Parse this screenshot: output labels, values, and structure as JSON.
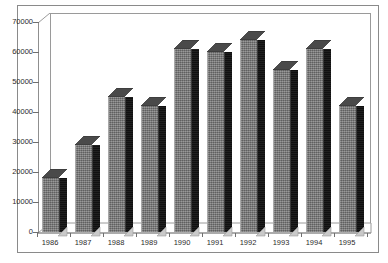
{
  "chart_data": {
    "type": "bar",
    "title": "",
    "subtitle": "",
    "xlabel": "",
    "ylabel": "",
    "categories": [
      "1986",
      "1987",
      "1988",
      "1989",
      "1990",
      "1991",
      "1992",
      "1993",
      "1994",
      "1995"
    ],
    "values": [
      18000,
      29000,
      45000,
      42000,
      61000,
      60000,
      64000,
      54000,
      61000,
      42000
    ],
    "series": [
      {
        "name": "",
        "values": [
          18000,
          29000,
          45000,
          42000,
          61000,
          60000,
          64000,
          54000,
          61000,
          42000
        ]
      }
    ],
    "ylim": [
      0,
      70000
    ],
    "ytick_values": [
      0,
      10000,
      20000,
      30000,
      40000,
      50000,
      60000,
      70000
    ],
    "ytick_labels": [
      "0",
      "10000",
      "20000",
      "30000",
      "40000",
      "50000",
      "60000",
      "70000"
    ],
    "grid": false,
    "legend": false,
    "legend_position": "none",
    "style": "3d-column",
    "colors": {
      "bar_front": "#7d7d7d",
      "bar_side": "#141414",
      "bar_top": "#4a4a4a",
      "axis": "#8a8a8a",
      "text": "#2b2b2b",
      "background": "#ffffff"
    }
  }
}
